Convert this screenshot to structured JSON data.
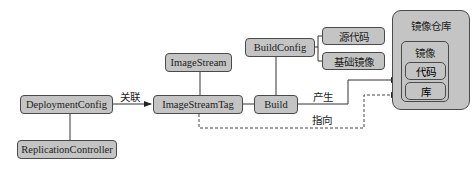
{
  "diagram": {
    "nodes": {
      "deployment_config": "DeploymentConfig",
      "replication_controller": "ReplicationController",
      "image_stream_tag": "ImageStreamTag",
      "image_stream": "ImageStream",
      "build": "Build",
      "build_config": "BuildConfig",
      "source_code": "源代码",
      "base_image": "基础镜像",
      "image_registry": "镜像仓库",
      "image": "镜像",
      "code": "代码",
      "library": "库"
    },
    "edges": [
      {
        "from": "DeploymentConfig",
        "to": "ImageStreamTag",
        "label": "关联",
        "style": "solid-arrow"
      },
      {
        "from": "DeploymentConfig",
        "to": "ReplicationController",
        "style": "solid"
      },
      {
        "from": "ImageStream",
        "to": "ImageStreamTag",
        "style": "solid"
      },
      {
        "from": "ImageStreamTag",
        "to": "Build",
        "style": "solid"
      },
      {
        "from": "BuildConfig",
        "to": "Build",
        "style": "solid"
      },
      {
        "from": "BuildConfig",
        "to": "源代码",
        "style": "bracket"
      },
      {
        "from": "BuildConfig",
        "to": "基础镜像",
        "style": "bracket"
      },
      {
        "from": "Build",
        "to": "镜像仓库",
        "label": "产生",
        "style": "solid-arrow"
      },
      {
        "from": "ImageStreamTag",
        "to": "镜像仓库",
        "label": "指向",
        "style": "dashed-arrow"
      }
    ],
    "edge_labels": {
      "associate": "关联",
      "produce": "产生",
      "point_to": "指向"
    }
  }
}
